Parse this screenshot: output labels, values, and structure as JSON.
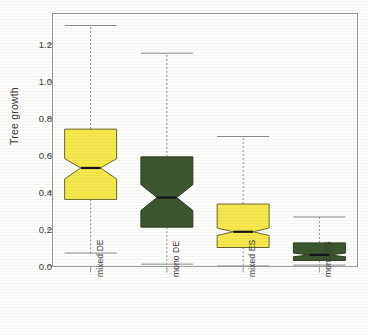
{
  "chart_data": {
    "type": "box",
    "title": "",
    "xlabel": "",
    "ylabel": "Tree growth",
    "ylim": [
      -0.06,
      1.38
    ],
    "yticks": [
      0.0,
      0.2,
      0.4,
      0.6,
      0.8,
      1.0,
      1.2
    ],
    "ytick_labels": [
      "0.0",
      "0.2",
      "0.4",
      "0.6",
      "0.8",
      "1.0",
      "1.2"
    ],
    "grid": false,
    "legend": "none",
    "notched": true,
    "categories": [
      "mixed DE",
      "mono DE",
      "mixed ES",
      "mono ES"
    ],
    "boxes": [
      {
        "label": "mixed DE",
        "color": "#F5E84C",
        "edge_color": "#6a6a30",
        "lower_whisker": 0.07,
        "q1": 0.36,
        "median": 0.53,
        "q3": 0.74,
        "upper_whisker": 1.3,
        "notch_lower": 0.47,
        "notch_upper": 0.58
      },
      {
        "label": "mono DE",
        "color": "#3D5631",
        "edge_color": "#2e3f24",
        "lower_whisker": 0.01,
        "q1": 0.21,
        "median": 0.37,
        "q3": 0.59,
        "upper_whisker": 1.15,
        "notch_lower": 0.3,
        "notch_upper": 0.44
      },
      {
        "label": "mixed ES",
        "color": "#F5E84C",
        "edge_color": "#6a6a30",
        "lower_whisker": 0.0,
        "q1": 0.1,
        "median": 0.185,
        "q3": 0.335,
        "upper_whisker": 0.7,
        "notch_lower": 0.165,
        "notch_upper": 0.205
      },
      {
        "label": "mono ES",
        "color": "#3D5631",
        "edge_color": "#2e3f24",
        "lower_whisker": 0.005,
        "q1": 0.03,
        "median": 0.06,
        "q3": 0.125,
        "upper_whisker": 0.265,
        "notch_lower": 0.05,
        "notch_upper": 0.07
      }
    ]
  },
  "axis": {
    "y_title": "Tree growth"
  },
  "colors": {
    "mixed": "#F5E84C",
    "mono": "#3D5631",
    "frame": "#9a9a9a",
    "median": "#141414",
    "whisker": "#8c8c8c"
  }
}
